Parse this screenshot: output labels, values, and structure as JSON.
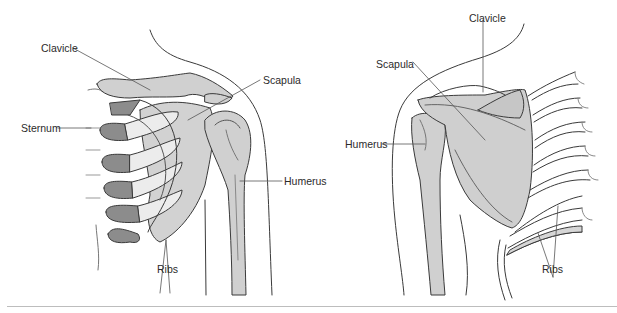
{
  "figure": {
    "panels": [
      {
        "id": "anterior-view",
        "labels": {
          "clavicle": "Clavicle",
          "scapula": "Scapula",
          "sternum": "Sternum",
          "humerus": "Humerus",
          "ribs": "Ribs"
        }
      },
      {
        "id": "posterior-view",
        "labels": {
          "clavicle": "Clavicle",
          "scapula": "Scapula",
          "humerus": "Humerus",
          "ribs": "Ribs"
        }
      }
    ],
    "colors": {
      "bone_fill": "#cfcfcf",
      "bone_dark": "#8c8c8c",
      "outline": "#3a3a3a",
      "leader_line": "#555555",
      "divider": "#bdbdbd"
    }
  }
}
